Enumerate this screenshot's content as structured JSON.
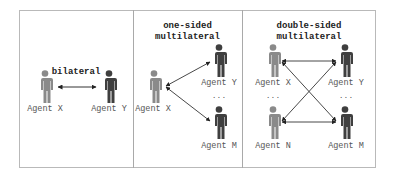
{
  "colors": {
    "agent_source": "#8a8a8a",
    "agent_target": "#3f3f3f",
    "arrow": "#333333",
    "frame": "#b9b9b9"
  },
  "panels": [
    {
      "title": "bilateral",
      "agents": [
        {
          "label": "Agent X",
          "role": "source",
          "icon": "person-icon"
        },
        {
          "label": "Agent Y",
          "role": "target",
          "icon": "person-icon"
        }
      ]
    },
    {
      "title_line1": "one-sided",
      "title_line2": "multilateral",
      "agents": [
        {
          "label": "Agent X",
          "role": "source",
          "icon": "person-icon"
        },
        {
          "label": "Agent Y",
          "role": "target",
          "icon": "person-icon"
        },
        {
          "label": "Agent M",
          "role": "target",
          "icon": "person-icon"
        }
      ],
      "ellipsis": "..."
    },
    {
      "title_line1": "double-sided",
      "title_line2": "multilateral",
      "agents": [
        {
          "label": "Agent X",
          "role": "source",
          "icon": "person-icon"
        },
        {
          "label": "Agent Y",
          "role": "target",
          "icon": "person-icon"
        },
        {
          "label": "Agent N",
          "role": "source",
          "icon": "person-icon"
        },
        {
          "label": "Agent M",
          "role": "target",
          "icon": "person-icon"
        }
      ],
      "ellipsis_left": "...",
      "ellipsis_right": "..."
    }
  ]
}
